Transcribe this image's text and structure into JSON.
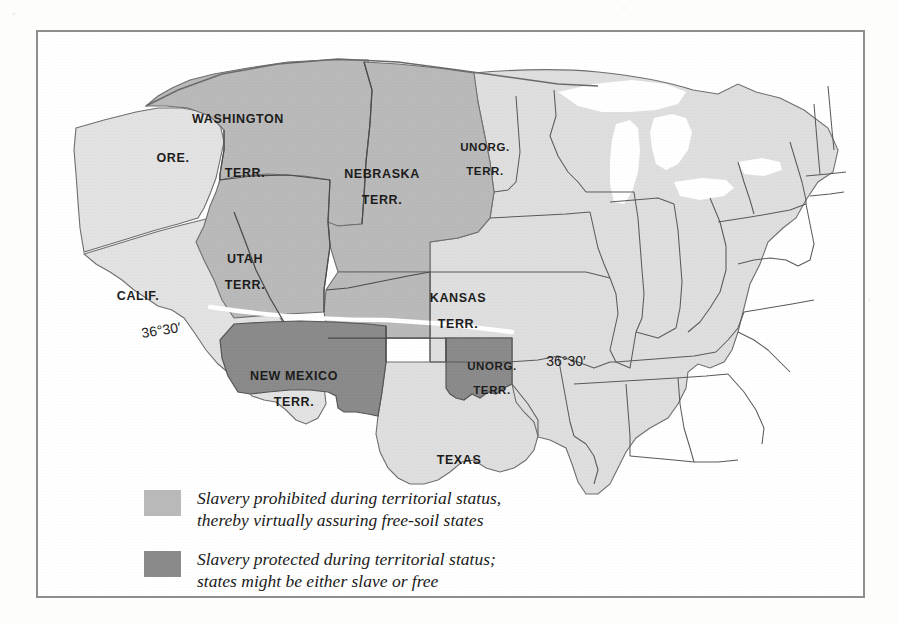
{
  "map": {
    "title": "Kansas-Nebraska Act territorial map",
    "colors": {
      "free_soil_fill": "#b9b9b9",
      "slavery_protected_fill": "#8a8a8a",
      "state_fill": "#dedede",
      "border_line": "#4a4a4a",
      "outline": "#555555",
      "frame": "#8e8e8e",
      "water": "#ffffff",
      "compromise_line": "#ffffff",
      "label_text": "#1c1c1c"
    },
    "labels": [
      {
        "name": "washington-territory",
        "line1": "WASHINGTON",
        "line2": "TERR.",
        "x": 200,
        "y": 88,
        "x2": 207,
        "y2": 142
      },
      {
        "name": "oregon",
        "line1": "ORE.",
        "x": 135,
        "y": 127
      },
      {
        "name": "california",
        "line1": "CALIF.",
        "x": 100,
        "y": 265
      },
      {
        "name": "utah-territory",
        "line1": "UTAH",
        "line2": "TERR.",
        "x": 207,
        "y": 228,
        "x2": 207,
        "y2": 254
      },
      {
        "name": "nebraska-territory",
        "line1": "NEBRASKA",
        "line2": "TERR.",
        "x": 344,
        "y": 143,
        "x2": 344,
        "y2": 169
      },
      {
        "name": "unorganized-territory-north",
        "line1": "UNORG.",
        "line2": "TERR.",
        "x": 447,
        "y": 115,
        "x2": 447,
        "y2": 139
      },
      {
        "name": "kansas-territory",
        "line1": "KANSAS",
        "line2": "TERR.",
        "x": 420,
        "y": 267,
        "x2": 420,
        "y2": 293
      },
      {
        "name": "new-mexico-territory",
        "line1": "NEW MEXICO",
        "line2": "TERR.",
        "x": 256,
        "y": 345,
        "x2": 256,
        "y2": 371
      },
      {
        "name": "unorganized-territory-south",
        "line1": "UNORG.",
        "line2": "TERR.",
        "x": 454,
        "y": 334,
        "x2": 454,
        "y2": 358
      },
      {
        "name": "texas",
        "line1": "TEXAS",
        "x": 421,
        "y": 429
      }
    ],
    "coordinates": [
      {
        "name": "compromise-line-label-west",
        "text": "36°30′",
        "x": 123,
        "y": 298,
        "tilted": true
      },
      {
        "name": "compromise-line-label-east",
        "text": "36°30′",
        "x": 528,
        "y": 329,
        "tilted": false
      }
    ]
  },
  "legend": {
    "items": [
      {
        "name": "legend-free-soil",
        "swatch_color": "#b9b9b9",
        "line1": "Slavery prohibited during territorial status,",
        "line2": "thereby virtually assuring free-soil states"
      },
      {
        "name": "legend-slavery-protected",
        "swatch_color": "#8a8a8a",
        "line1": "Slavery protected during territorial status;",
        "line2": "states might be either slave or free"
      }
    ]
  }
}
